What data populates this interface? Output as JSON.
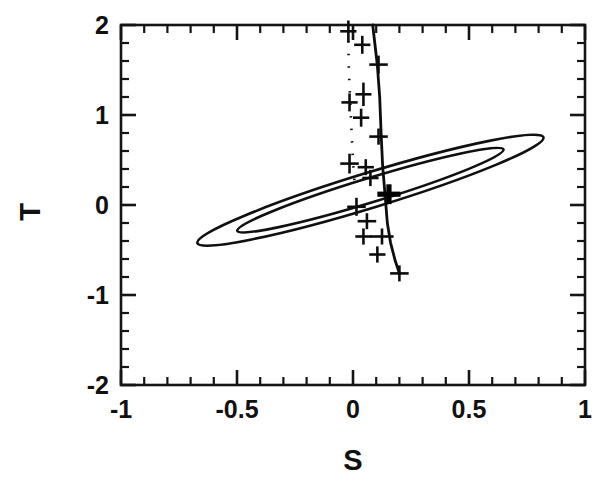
{
  "figure": {
    "title": "",
    "background_color": "#ffffff",
    "ink_color": "#111111"
  },
  "axes": {
    "x_title": "S",
    "y_title": "T",
    "x_tick_labels": [
      "-1",
      "-0.5",
      "0",
      "0.5",
      "1"
    ],
    "y_tick_labels": [
      "2",
      "1",
      "0",
      "-1",
      "-2"
    ]
  },
  "chart_data": {
    "type": "scatter",
    "title": "",
    "xlabel": "S",
    "ylabel": "T",
    "xlim": [
      -1,
      1
    ],
    "ylim": [
      -2,
      2
    ],
    "grid": false,
    "legend": null,
    "x_major_ticks": [
      -1,
      -0.5,
      0,
      0.5,
      1
    ],
    "y_major_ticks": [
      -2,
      -1,
      0,
      1,
      2
    ],
    "x_minor_tick_step": 0.1,
    "y_minor_tick_step": 0.2,
    "ticks_direction": "inward",
    "frame": "full-box",
    "series": [
      {
        "name": "confidence-contours",
        "type": "ellipse-contours",
        "description": "Two nested tilted confidence ellipses centered near (0.07, 0.17)",
        "ellipses": [
          {
            "label": "outer-contour",
            "center_x": 0.075,
            "center_y": 0.165,
            "semi_major": 0.78,
            "semi_minor": 0.195,
            "angle_deg": 17.0
          },
          {
            "label": "inner-contour",
            "center_x": 0.075,
            "center_y": 0.165,
            "semi_major": 0.6,
            "semi_minor": 0.135,
            "angle_deg": 17.0
          }
        ]
      },
      {
        "name": "solid-track",
        "type": "line",
        "style": "solid",
        "description": "Solid curve of model predictions running steeply downward",
        "points": [
          {
            "x": 0.085,
            "y": 2.0
          },
          {
            "x": 0.105,
            "y": 1.55
          },
          {
            "x": 0.115,
            "y": 1.2
          },
          {
            "x": 0.122,
            "y": 0.75
          },
          {
            "x": 0.128,
            "y": 0.42
          },
          {
            "x": 0.138,
            "y": 0.12
          },
          {
            "x": 0.148,
            "y": -0.2
          },
          {
            "x": 0.162,
            "y": -0.42
          },
          {
            "x": 0.182,
            "y": -0.62
          },
          {
            "x": 0.2,
            "y": -0.76
          }
        ]
      },
      {
        "name": "dotted-track",
        "type": "line",
        "style": "dotted",
        "description": "Dotted curve nearly vertical near S = -0.02",
        "points": [
          {
            "x": -0.02,
            "y": 1.82
          },
          {
            "x": -0.018,
            "y": 1.5
          },
          {
            "x": -0.012,
            "y": 1.15
          },
          {
            "x": -0.006,
            "y": 0.8
          },
          {
            "x": 0.0,
            "y": 0.48
          },
          {
            "x": 0.008,
            "y": 0.2
          }
        ]
      },
      {
        "name": "data-points",
        "type": "scatter-with-errorbars",
        "marker": "plus-cross",
        "description": "Cross markers with horizontal and vertical error bars along the tracks",
        "points": [
          {
            "x": -0.02,
            "y": 1.93,
            "xerr": 0.035,
            "yerr": 0.12,
            "bold": false
          },
          {
            "x": 0.04,
            "y": 1.78,
            "xerr": 0.035,
            "yerr": 0.1,
            "bold": false
          },
          {
            "x": 0.11,
            "y": 1.56,
            "xerr": 0.04,
            "yerr": 0.1,
            "bold": false
          },
          {
            "x": 0.045,
            "y": 1.23,
            "xerr": 0.02,
            "yerr": 0.13,
            "bold": false
          },
          {
            "x": -0.015,
            "y": 1.14,
            "xerr": 0.035,
            "yerr": 0.1,
            "bold": false
          },
          {
            "x": 0.035,
            "y": 0.97,
            "xerr": 0.035,
            "yerr": 0.1,
            "bold": false
          },
          {
            "x": 0.11,
            "y": 0.76,
            "xerr": 0.04,
            "yerr": 0.09,
            "bold": false
          },
          {
            "x": -0.015,
            "y": 0.46,
            "xerr": 0.04,
            "yerr": 0.11,
            "bold": false
          },
          {
            "x": 0.055,
            "y": 0.42,
            "xerr": 0.035,
            "yerr": 0.07,
            "bold": false
          },
          {
            "x": 0.075,
            "y": 0.3,
            "xerr": 0.035,
            "yerr": 0.09,
            "bold": false
          },
          {
            "x": 0.155,
            "y": 0.12,
            "xerr": 0.05,
            "yerr": 0.11,
            "bold": true
          },
          {
            "x": 0.015,
            "y": -0.02,
            "xerr": 0.04,
            "yerr": 0.1,
            "bold": false
          },
          {
            "x": 0.06,
            "y": -0.18,
            "xerr": 0.04,
            "yerr": 0.08,
            "bold": false
          },
          {
            "x": 0.045,
            "y": -0.35,
            "xerr": 0.035,
            "yerr": 0.09,
            "bold": false
          },
          {
            "x": 0.125,
            "y": -0.35,
            "xerr": 0.05,
            "yerr": 0.07,
            "bold": false
          },
          {
            "x": 0.105,
            "y": -0.55,
            "xerr": 0.035,
            "yerr": 0.09,
            "bold": false
          },
          {
            "x": 0.2,
            "y": -0.76,
            "xerr": 0.04,
            "yerr": 0.08,
            "bold": false
          }
        ]
      }
    ]
  }
}
